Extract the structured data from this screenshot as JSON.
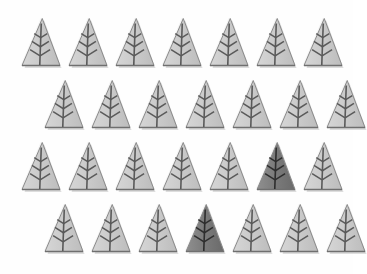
{
  "scene": {
    "title": "Tree icon grid",
    "background_color": "#fefefe",
    "width": 353,
    "height": 274,
    "icon_name": "pine-tree-icon",
    "total_icons": 28,
    "rows": 4,
    "columns": 7,
    "selected_count": 2
  },
  "palette": {
    "normal_fill_light": "#d6d6d6",
    "normal_fill_mid": "#cacaca",
    "normal_fill_dark": "#bdbdbd",
    "selected_fill_light": "#8f8f8f",
    "selected_fill_mid": "#7c7c7c",
    "selected_fill_dark": "#6a6a6a",
    "outline_color": "#8a8a8a",
    "outline_highlight": "#f4f4f4",
    "branch_color": "#5a5a5a",
    "selected_branch_color": "#2e2e2e",
    "shadow_color": "#b5b5b5"
  },
  "geometry": {
    "tree_width": 42,
    "tree_height": 56,
    "col_step": 47,
    "row_step": 62,
    "row_origins_x": [
      20,
      43,
      20,
      43
    ],
    "row_origins_y": [
      16,
      78,
      140,
      202
    ]
  },
  "grid": {
    "rows": [
      {
        "row_index": 0,
        "label": "row-1",
        "offset": "aligned-left",
        "cells": [
          {
            "index": 0,
            "state": "normal",
            "label": "tree-1-1"
          },
          {
            "index": 1,
            "state": "normal",
            "label": "tree-1-2"
          },
          {
            "index": 2,
            "state": "normal",
            "label": "tree-1-3"
          },
          {
            "index": 3,
            "state": "normal",
            "label": "tree-1-4"
          },
          {
            "index": 4,
            "state": "normal",
            "label": "tree-1-5"
          },
          {
            "index": 5,
            "state": "normal",
            "label": "tree-1-6"
          },
          {
            "index": 6,
            "state": "normal",
            "label": "tree-1-7"
          }
        ]
      },
      {
        "row_index": 1,
        "label": "row-2",
        "offset": "shifted-right",
        "cells": [
          {
            "index": 0,
            "state": "normal",
            "label": "tree-2-1"
          },
          {
            "index": 1,
            "state": "normal",
            "label": "tree-2-2"
          },
          {
            "index": 2,
            "state": "normal",
            "label": "tree-2-3"
          },
          {
            "index": 3,
            "state": "normal",
            "label": "tree-2-4"
          },
          {
            "index": 4,
            "state": "normal",
            "label": "tree-2-5"
          },
          {
            "index": 5,
            "state": "normal",
            "label": "tree-2-6"
          },
          {
            "index": 6,
            "state": "normal",
            "label": "tree-2-7"
          }
        ]
      },
      {
        "row_index": 2,
        "label": "row-3",
        "offset": "aligned-left",
        "cells": [
          {
            "index": 0,
            "state": "normal",
            "label": "tree-3-1"
          },
          {
            "index": 1,
            "state": "normal",
            "label": "tree-3-2"
          },
          {
            "index": 2,
            "state": "normal",
            "label": "tree-3-3"
          },
          {
            "index": 3,
            "state": "normal",
            "label": "tree-3-4"
          },
          {
            "index": 4,
            "state": "normal",
            "label": "tree-3-5"
          },
          {
            "index": 5,
            "state": "selected",
            "label": "tree-3-6"
          },
          {
            "index": 6,
            "state": "normal",
            "label": "tree-3-7"
          }
        ]
      },
      {
        "row_index": 3,
        "label": "row-4",
        "offset": "shifted-right",
        "cells": [
          {
            "index": 0,
            "state": "normal",
            "label": "tree-4-1"
          },
          {
            "index": 1,
            "state": "normal",
            "label": "tree-4-2"
          },
          {
            "index": 2,
            "state": "normal",
            "label": "tree-4-3"
          },
          {
            "index": 3,
            "state": "selected",
            "label": "tree-4-4"
          },
          {
            "index": 4,
            "state": "normal",
            "label": "tree-4-5"
          },
          {
            "index": 5,
            "state": "normal",
            "label": "tree-4-6"
          },
          {
            "index": 6,
            "state": "normal",
            "label": "tree-4-7"
          }
        ]
      }
    ]
  }
}
